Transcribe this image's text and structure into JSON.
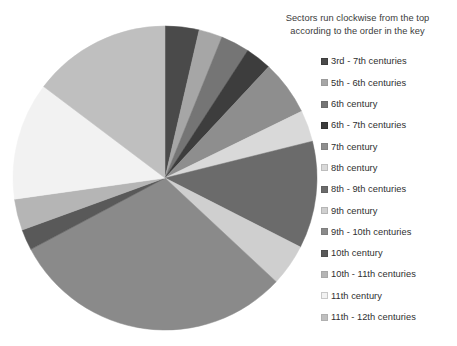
{
  "caption": {
    "line1": "Sectors run clockwise from the top",
    "line2": "according to the order in the key"
  },
  "chart_data": {
    "type": "pie",
    "title": "Sectors run clockwise from the top according to the order in the key",
    "subtitle": "",
    "xlabel": "",
    "ylabel": "",
    "grid": false,
    "legend_position": "right",
    "start_angle_deg": 0,
    "direction": "clockwise",
    "center_px": [
      165,
      178
    ],
    "radius_px": 152,
    "categories": [
      "3rd - 7th centuries",
      "5th - 6th centuries",
      "6th century",
      "6th - 7th centuries",
      "7th century",
      "8th century",
      "8th - 9th centuries",
      "9th century",
      "9th - 10th centuries",
      "10th century",
      "10th - 11th centuries",
      "11th century",
      "11th - 12th centuries"
    ],
    "values": [
      3.6,
      2.5,
      3.1,
      2.8,
      5.8,
      3.3,
      11.4,
      4.4,
      30.3,
      2.2,
      3.3,
      12.5,
      14.8
    ],
    "units": "percent",
    "colors": [
      "#4a4a4a",
      "#a6a6a6",
      "#757575",
      "#3d3d3d",
      "#8e8e8e",
      "#d9d9d9",
      "#6b6b6b",
      "#cfcfcf",
      "#8a8a8a",
      "#595959",
      "#b5b5b5",
      "#f2f2f2",
      "#bfbfbf"
    ],
    "slice_angles_deg": [
      {
        "start": 0,
        "end": 13
      },
      {
        "start": 13,
        "end": 22
      },
      {
        "start": 22,
        "end": 33
      },
      {
        "start": 33,
        "end": 43
      },
      {
        "start": 43,
        "end": 64
      },
      {
        "start": 64,
        "end": 76
      },
      {
        "start": 76,
        "end": 117
      },
      {
        "start": 117,
        "end": 133
      },
      {
        "start": 133,
        "end": 242
      },
      {
        "start": 242,
        "end": 250
      },
      {
        "start": 250,
        "end": 262
      },
      {
        "start": 262,
        "end": 307
      },
      {
        "start": 307,
        "end": 360
      }
    ]
  },
  "legend": {
    "items": [
      {
        "label": "3rd - 7th centuries",
        "color": "#4a4a4a",
        "border": "#3d3d3d"
      },
      {
        "label": "5th - 6th centuries",
        "color": "#a6a6a6",
        "border": "#9a9a9a"
      },
      {
        "label": "6th century",
        "color": "#757575",
        "border": "#6b6b6b"
      },
      {
        "label": "6th - 7th centuries",
        "color": "#3d3d3d",
        "border": "#333333"
      },
      {
        "label": "7th century",
        "color": "#8e8e8e",
        "border": "#828282"
      },
      {
        "label": "8th century",
        "color": "#d9d9d9",
        "border": "#bdbdbd"
      },
      {
        "label": "8th - 9th centuries",
        "color": "#6b6b6b",
        "border": "#616161"
      },
      {
        "label": "9th century",
        "color": "#cfcfcf",
        "border": "#b5b5b5"
      },
      {
        "label": "9th - 10th centuries",
        "color": "#8a8a8a",
        "border": "#7e7e7e"
      },
      {
        "label": "10th century",
        "color": "#595959",
        "border": "#4f4f4f"
      },
      {
        "label": "10th - 11th centuries",
        "color": "#b5b5b5",
        "border": "#a8a8a8"
      },
      {
        "label": "11th century",
        "color": "#f2f2f2",
        "border": "#c8c8c8"
      },
      {
        "label": "11th - 12th centuries",
        "color": "#bfbfbf",
        "border": "#b0b0b0"
      }
    ]
  }
}
